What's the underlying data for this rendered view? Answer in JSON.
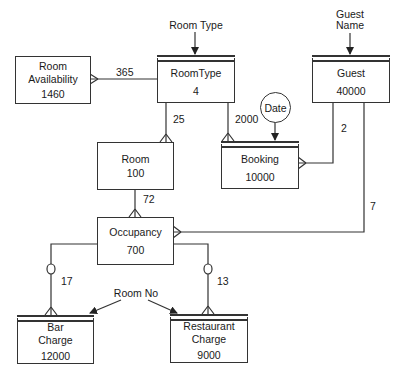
{
  "diagram": {
    "type": "entity-relationship / logical data structure",
    "entities": [
      {
        "id": "room_availability",
        "name": "Room Availability",
        "name_lines": [
          "Room",
          "Availability"
        ],
        "volume": "1460",
        "keyed": false
      },
      {
        "id": "room_type",
        "name": "RoomType",
        "name_lines": [
          "RoomType"
        ],
        "volume": "4",
        "keyed": true
      },
      {
        "id": "guest",
        "name": "Guest",
        "name_lines": [
          "Guest"
        ],
        "volume": "40000",
        "keyed": true
      },
      {
        "id": "room",
        "name": "Room",
        "name_lines": [
          "Room"
        ],
        "volume": "100",
        "keyed": false
      },
      {
        "id": "booking",
        "name": "Booking",
        "name_lines": [
          "Booking"
        ],
        "volume": "10000",
        "keyed": true
      },
      {
        "id": "occupancy",
        "name": "Occupancy",
        "name_lines": [
          "Occupancy"
        ],
        "volume": "700",
        "keyed": false
      },
      {
        "id": "bar_charge",
        "name": "Bar Charge",
        "name_lines": [
          "Bar",
          "Charge"
        ],
        "volume": "12000",
        "keyed": true
      },
      {
        "id": "restaurant_charge",
        "name": "Restaurant Charge",
        "name_lines": [
          "Restaurant",
          "Charge"
        ],
        "volume": "9000",
        "keyed": true
      }
    ],
    "entry_points": [
      {
        "label": "Room Type",
        "target": "room_type"
      },
      {
        "label_lines": [
          "Guest",
          "Name"
        ],
        "label": "Guest Name",
        "target": "guest"
      },
      {
        "label": "Date",
        "target": "booking",
        "shape": "circle"
      },
      {
        "label": "Room No",
        "targets": [
          "bar_charge",
          "restaurant_charge"
        ]
      }
    ],
    "relationships": [
      {
        "from": "room_type",
        "to": "room_availability",
        "cardinality": "365",
        "optional": false
      },
      {
        "from": "room_type",
        "to": "room",
        "cardinality": "25",
        "optional": false
      },
      {
        "from": "room_type",
        "to": "booking",
        "cardinality": "2000",
        "optional": false
      },
      {
        "from": "guest",
        "to": "booking",
        "cardinality": "2",
        "optional": false
      },
      {
        "from": "guest",
        "to": "occupancy",
        "cardinality": "7",
        "optional": false
      },
      {
        "from": "room",
        "to": "occupancy",
        "cardinality": "72",
        "optional": false
      },
      {
        "from": "occupancy",
        "to": "bar_charge",
        "cardinality": "17",
        "optional": true
      },
      {
        "from": "occupancy",
        "to": "restaurant_charge",
        "cardinality": "13",
        "optional": true
      }
    ]
  },
  "colors": {
    "line": "#333333",
    "background": "#ffffff",
    "text": "#1a1a1a"
  }
}
